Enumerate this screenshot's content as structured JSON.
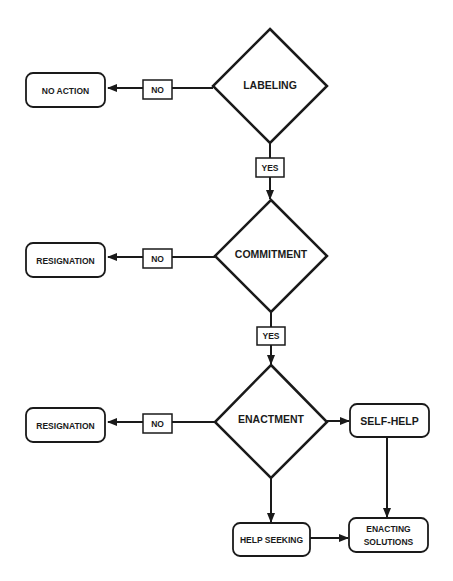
{
  "diagram": {
    "type": "flowchart",
    "colors": {
      "stroke": "#1a1a1a",
      "fill": "#ffffff",
      "background": "#ffffff"
    },
    "decisions": [
      {
        "id": "labeling",
        "label": "LABELING"
      },
      {
        "id": "commitment",
        "label": "COMMITMENT"
      },
      {
        "id": "enactment",
        "label": "ENACTMENT"
      }
    ],
    "outcomes": [
      {
        "id": "no_action",
        "label": "NO ACTION"
      },
      {
        "id": "resignation_1",
        "label": "RESIGNATION"
      },
      {
        "id": "resignation_2",
        "label": "RESIGNATION"
      },
      {
        "id": "self_help",
        "label": "SELF-HELP"
      },
      {
        "id": "help_seeking",
        "label": "HELP SEEKING"
      },
      {
        "id": "enacting_solutions",
        "label_line1": "ENACTING",
        "label_line2": "SOLUTIONS"
      }
    ],
    "edge_labels": {
      "no_1": "NO",
      "yes_1": "YES",
      "no_2": "NO",
      "yes_2": "YES",
      "no_3": "NO"
    },
    "edges": [
      {
        "from": "labeling",
        "to": "no_action",
        "label": "NO"
      },
      {
        "from": "labeling",
        "to": "commitment",
        "label": "YES"
      },
      {
        "from": "commitment",
        "to": "resignation_1",
        "label": "NO"
      },
      {
        "from": "commitment",
        "to": "enactment",
        "label": "YES"
      },
      {
        "from": "enactment",
        "to": "resignation_2",
        "label": "NO"
      },
      {
        "from": "enactment",
        "to": "self_help",
        "label": ""
      },
      {
        "from": "enactment",
        "to": "help_seeking",
        "label": ""
      },
      {
        "from": "self_help",
        "to": "enacting_solutions",
        "label": ""
      },
      {
        "from": "help_seeking",
        "to": "enacting_solutions",
        "label": ""
      }
    ]
  }
}
